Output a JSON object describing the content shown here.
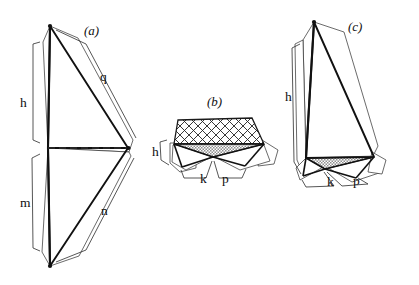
{
  "figure": {
    "type": "geometric-diagram",
    "background_color": "#ffffff",
    "stroke_color": "#1a1a1a",
    "panels": [
      {
        "id": "a",
        "label": "(a)",
        "label_pos": {
          "x": 84,
          "y": 24
        },
        "dimensions": [
          {
            "name": "h",
            "label": "h",
            "x": 20,
            "y": 96
          },
          {
            "name": "m",
            "label": "m",
            "x": 20,
            "y": 196
          },
          {
            "name": "q",
            "label": "q",
            "x": 100,
            "y": 70
          },
          {
            "name": "n",
            "label": "n",
            "x": 101,
            "y": 204
          }
        ]
      },
      {
        "id": "b",
        "label": "(b)",
        "label_pos": {
          "x": 207,
          "y": 95
        },
        "fills": {
          "hatch": "cross-hatch",
          "shade": "stipple-gray"
        },
        "shade_color": "#b9b9b9",
        "dimensions": [
          {
            "name": "h",
            "label": "h",
            "x": 152,
            "y": 145
          },
          {
            "name": "k",
            "label": "k",
            "x": 200,
            "y": 172
          },
          {
            "name": "p",
            "label": "p",
            "x": 222,
            "y": 172
          }
        ]
      },
      {
        "id": "c",
        "label": "(c)",
        "label_pos": {
          "x": 348,
          "y": 20
        },
        "fills": {
          "shade": "stipple-gray"
        },
        "shade_color": "#b9b9b9",
        "dimensions": [
          {
            "name": "h",
            "label": "h",
            "x": 285,
            "y": 90
          },
          {
            "name": "k",
            "label": "k",
            "x": 327,
            "y": 175
          },
          {
            "name": "p",
            "label": "p",
            "x": 353,
            "y": 174
          }
        ]
      }
    ]
  }
}
